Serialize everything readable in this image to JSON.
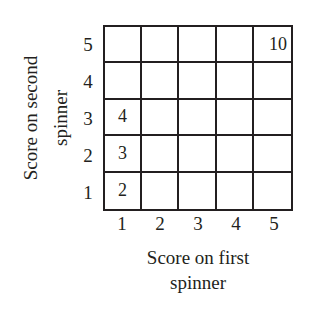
{
  "diagram": {
    "type": "grid-table",
    "y_axis": {
      "label_line1": "Score on second",
      "label_line2": "spinner",
      "ticks": [
        "5",
        "4",
        "3",
        "2",
        "1"
      ]
    },
    "x_axis": {
      "label_line1": "Score on first",
      "label_line2": "spinner",
      "ticks": [
        "1",
        "2",
        "3",
        "4",
        "5"
      ]
    },
    "rows": [
      [
        "",
        "",
        "",
        "",
        "10"
      ],
      [
        "",
        "",
        "",
        "",
        ""
      ],
      [
        "4",
        "",
        "",
        "",
        ""
      ],
      [
        "3",
        "",
        "",
        "",
        ""
      ],
      [
        "2",
        "",
        "",
        "",
        ""
      ]
    ]
  }
}
